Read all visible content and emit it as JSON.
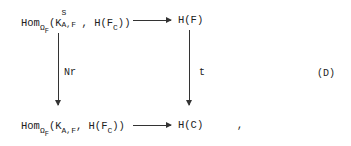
{
  "diagram": {
    "top_left": {
      "hom": "Hom",
      "hom_sub": "Ω",
      "hom_subsub": "F",
      "open": "(K",
      "k_sup": "S",
      "k_sub": "A,F",
      "rest": ", H(F",
      "f_sub": "C",
      "close": "))"
    },
    "top_right": "H(F)",
    "bottom_left": {
      "hom": "Hom",
      "hom_sub": "Ω",
      "hom_subsub": "F",
      "open": "(K",
      "k_sub": "A,F",
      "rest": ", H(F",
      "f_sub": "C",
      "close": "))"
    },
    "bottom_right": "H(C)",
    "left_arrow_label": "Nr",
    "right_arrow_label": "t",
    "equation_tag": "(D)",
    "trailing_punct": ","
  }
}
